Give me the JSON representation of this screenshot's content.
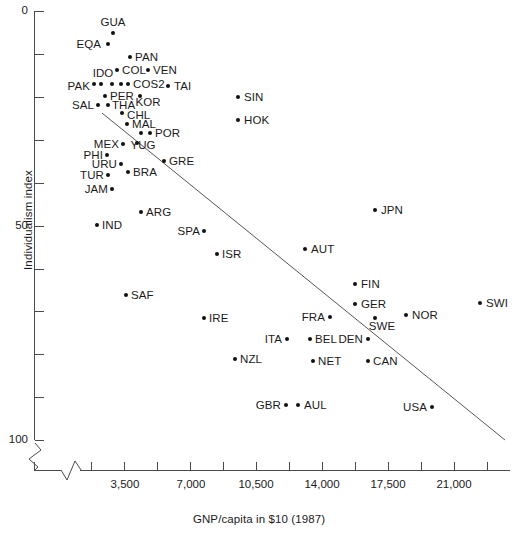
{
  "chart_data": {
    "type": "scatter",
    "title": "",
    "xlabel": "GNP/capita in $10 (1987)",
    "ylabel": "Individualism index",
    "xlim": [
      0,
      22750
    ],
    "ylim": [
      0,
      100
    ],
    "y_inverted": true,
    "grid": false,
    "legend": "none",
    "axis_break_x": true,
    "axis_break_y": true,
    "x_ticks_major": [
      "3,500",
      "7,000",
      "10,500",
      "14,000",
      "17,500",
      "21,000"
    ],
    "x_tick_values": [
      3500,
      7000,
      10500,
      14000,
      17500,
      21000
    ],
    "y_ticks_major": [
      "0",
      "50",
      "100"
    ],
    "y_tick_values": [
      0,
      50,
      100
    ],
    "y_minor_step": 10,
    "trend_line": {
      "x1": 102,
      "y1": 113,
      "x2": 505,
      "y2": 440
    },
    "points": [
      {
        "label": "GUA",
        "px": 113,
        "py": 33,
        "side": "c",
        "lx": 113,
        "ly": 22
      },
      {
        "label": "EQA",
        "px": 108,
        "py": 44,
        "side": "r",
        "lx": 101,
        "ly": 44
      },
      {
        "label": "PAN",
        "px": 130,
        "py": 57,
        "side": "l",
        "lx": 135,
        "ly": 57
      },
      {
        "label": "COL",
        "px": 117,
        "py": 70,
        "side": "l",
        "lx": 122,
        "ly": 70
      },
      {
        "label": "VEN",
        "px": 148,
        "py": 70,
        "side": "l",
        "lx": 153,
        "ly": 70
      },
      {
        "label": "IDO",
        "px": 101,
        "py": 84,
        "side": "c",
        "lx": 103,
        "ly": 73
      },
      {
        "label": "IDO2",
        "px": 112,
        "py": 84,
        "side": "n",
        "lx": 0,
        "ly": 0
      },
      {
        "label": "COS",
        "px": 121,
        "py": 84,
        "side": "n",
        "lx": 0,
        "ly": 0
      },
      {
        "label": "COS2",
        "px": 128,
        "py": 84,
        "side": "l",
        "lx": 133,
        "ly": 84
      },
      {
        "label": "PAK",
        "px": 94,
        "py": 84,
        "side": "r",
        "lx": 90,
        "ly": 86
      },
      {
        "label": "TAI",
        "px": 168,
        "py": 86,
        "side": "l",
        "lx": 174,
        "ly": 86
      },
      {
        "label": "PER",
        "px": 105,
        "py": 96,
        "side": "l",
        "lx": 110,
        "ly": 96
      },
      {
        "label": "KOR",
        "px": 140,
        "py": 96,
        "side": "c",
        "lx": 148,
        "ly": 102
      },
      {
        "label": "SAL",
        "px": 98,
        "py": 105,
        "side": "r",
        "lx": 94,
        "ly": 105
      },
      {
        "label": "THA",
        "px": 108,
        "py": 105,
        "side": "l",
        "lx": 112,
        "ly": 105
      },
      {
        "label": "CHL",
        "px": 122,
        "py": 113,
        "side": "l",
        "lx": 127,
        "ly": 115
      },
      {
        "label": "SIN",
        "px": 238,
        "py": 97,
        "side": "l",
        "lx": 244,
        "ly": 97
      },
      {
        "label": "HOK",
        "px": 238,
        "py": 120,
        "side": "l",
        "lx": 244,
        "ly": 120
      },
      {
        "label": "MAL",
        "px": 127,
        "py": 124,
        "side": "l",
        "lx": 132,
        "ly": 124
      },
      {
        "label": "POR",
        "px": 150,
        "py": 133,
        "side": "l",
        "lx": 155,
        "ly": 133
      },
      {
        "label": "POR2",
        "px": 141,
        "py": 133,
        "side": "n",
        "lx": 0,
        "ly": 0
      },
      {
        "label": "YUG",
        "px": 137,
        "py": 143,
        "side": "c",
        "lx": 143,
        "ly": 145
      },
      {
        "label": "MEX",
        "px": 123,
        "py": 144,
        "side": "r",
        "lx": 119,
        "ly": 144
      },
      {
        "label": "PHI",
        "px": 107,
        "py": 155,
        "side": "r",
        "lx": 103,
        "ly": 155
      },
      {
        "label": "URU",
        "px": 121,
        "py": 164,
        "side": "r",
        "lx": 117,
        "ly": 164
      },
      {
        "label": "GRE",
        "px": 164,
        "py": 161,
        "side": "l",
        "lx": 169,
        "ly": 161
      },
      {
        "label": "BRA",
        "px": 128,
        "py": 172,
        "side": "l",
        "lx": 133,
        "ly": 172
      },
      {
        "label": "TUR",
        "px": 108,
        "py": 175,
        "side": "r",
        "lx": 104,
        "ly": 175
      },
      {
        "label": "JAM",
        "px": 112,
        "py": 189,
        "side": "r",
        "lx": 108,
        "ly": 189
      },
      {
        "label": "ARG",
        "px": 141,
        "py": 212,
        "side": "l",
        "lx": 146,
        "ly": 212
      },
      {
        "label": "IND",
        "px": 97,
        "py": 225,
        "side": "l",
        "lx": 102,
        "ly": 225
      },
      {
        "label": "JPN",
        "px": 375,
        "py": 210,
        "side": "l",
        "lx": 381,
        "ly": 210
      },
      {
        "label": "SPA",
        "px": 204,
        "py": 231,
        "side": "r",
        "lx": 200,
        "ly": 231
      },
      {
        "label": "AUT",
        "px": 305,
        "py": 249,
        "side": "l",
        "lx": 311,
        "ly": 249
      },
      {
        "label": "ISR",
        "px": 217,
        "py": 254,
        "side": "l",
        "lx": 222,
        "ly": 254
      },
      {
        "label": "FIN",
        "px": 355,
        "py": 284,
        "side": "l",
        "lx": 361,
        "ly": 284
      },
      {
        "label": "GER",
        "px": 355,
        "py": 304,
        "side": "l",
        "lx": 361,
        "ly": 304
      },
      {
        "label": "SWI",
        "px": 480,
        "py": 303,
        "side": "l",
        "lx": 486,
        "ly": 303
      },
      {
        "label": "SAF",
        "px": 126,
        "py": 295,
        "side": "l",
        "lx": 131,
        "ly": 295
      },
      {
        "label": "NOR",
        "px": 406,
        "py": 315,
        "side": "l",
        "lx": 412,
        "ly": 315
      },
      {
        "label": "FRA",
        "px": 330,
        "py": 317,
        "side": "r",
        "lx": 325,
        "ly": 317
      },
      {
        "label": "SWE",
        "px": 375,
        "py": 318,
        "side": "c",
        "lx": 382,
        "ly": 326
      },
      {
        "label": "IRE",
        "px": 204,
        "py": 318,
        "side": "l",
        "lx": 209,
        "ly": 318
      },
      {
        "label": "ITA",
        "px": 287,
        "py": 339,
        "side": "r",
        "lx": 282,
        "ly": 339
      },
      {
        "label": "BEL",
        "px": 310,
        "py": 339,
        "side": "l",
        "lx": 315,
        "ly": 339
      },
      {
        "label": "DEN",
        "px": 368,
        "py": 339,
        "side": "r",
        "lx": 363,
        "ly": 339
      },
      {
        "label": "NZL",
        "px": 235,
        "py": 359,
        "side": "l",
        "lx": 240,
        "ly": 359
      },
      {
        "label": "NET",
        "px": 313,
        "py": 361,
        "side": "l",
        "lx": 318,
        "ly": 361
      },
      {
        "label": "CAN",
        "px": 368,
        "py": 361,
        "side": "l",
        "lx": 373,
        "ly": 361
      },
      {
        "label": "GBR",
        "px": 286,
        "py": 405,
        "side": "r",
        "lx": 281,
        "ly": 405
      },
      {
        "label": "AUL",
        "px": 298,
        "py": 405,
        "side": "l",
        "lx": 304,
        "ly": 405
      },
      {
        "label": "USA",
        "px": 432,
        "py": 407,
        "side": "r",
        "lx": 427,
        "ly": 407
      }
    ]
  },
  "axes": {
    "y_axis_top_px": 11,
    "y_axis_bottom_px": 440,
    "x_axis_y_px": 470,
    "plot_left_px": 35,
    "plot_right_px": 510
  }
}
